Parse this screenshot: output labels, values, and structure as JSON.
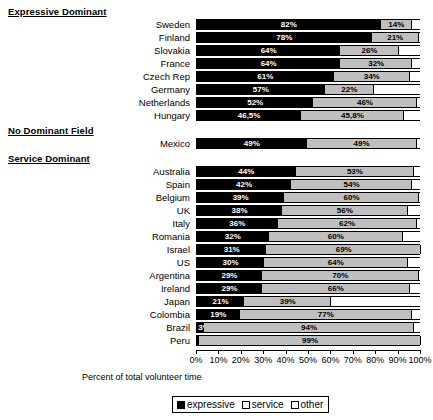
{
  "chart_data": {
    "type": "bar",
    "orientation": "horizontal",
    "stacked": true,
    "title": "",
    "xlabel": "Percent of total volunteer time",
    "ylabel": "",
    "xlim": [
      0,
      100
    ],
    "grid": false,
    "legend_position": "bottom",
    "axis_ticks": [
      "0%",
      "10%",
      "20%",
      "30%",
      "40%",
      "50%",
      "60%",
      "70%",
      "80%",
      "90%",
      "100%"
    ],
    "axis_tick_values": [
      0,
      10,
      20,
      30,
      40,
      50,
      60,
      70,
      80,
      90,
      100
    ],
    "legend": [
      {
        "name": "expressive",
        "color": "#000000"
      },
      {
        "name": "service",
        "color": "#bfbfbf"
      },
      {
        "name": "other",
        "color": "#ffffff"
      }
    ],
    "series": [
      {
        "name": "expressive",
        "color": "#000000"
      },
      {
        "name": "service",
        "color": "#bfbfbf"
      },
      {
        "name": "other",
        "color": "#ffffff"
      }
    ],
    "groups": [
      {
        "header": "Expressive Dominant",
        "rows": [
          {
            "category": "Sweden",
            "expressive": 82,
            "service": 14,
            "other": 4,
            "label_expressive": "82%",
            "label_service": "14%",
            "label_other": ""
          },
          {
            "category": "Finland",
            "expressive": 78,
            "service": 21,
            "other": 1,
            "label_expressive": "78%",
            "label_service": "21%",
            "label_other": ""
          },
          {
            "category": "Slovakia",
            "expressive": 64,
            "service": 26,
            "other": 10,
            "label_expressive": "64%",
            "label_service": "26%",
            "label_other": ""
          },
          {
            "category": "France",
            "expressive": 64,
            "service": 32,
            "other": 4,
            "label_expressive": "64%",
            "label_service": "32%",
            "label_other": ""
          },
          {
            "category": "Czech Rep",
            "expressive": 61,
            "service": 34,
            "other": 5,
            "label_expressive": "61%",
            "label_service": "34%",
            "label_other": ""
          },
          {
            "category": "Germany",
            "expressive": 57,
            "service": 22,
            "other": 21,
            "label_expressive": "57%",
            "label_service": "22%",
            "label_other": ""
          },
          {
            "category": "Netherlands",
            "expressive": 52,
            "service": 46,
            "other": 2,
            "label_expressive": "52%",
            "label_service": "46%",
            "label_other": ""
          },
          {
            "category": "Hungary",
            "expressive": 46.5,
            "service": 45.8,
            "other": 7.7,
            "label_expressive": "46,5%",
            "label_service": "45,8%",
            "label_other": ""
          }
        ]
      },
      {
        "header": "No Dominant Field",
        "rows": [
          {
            "category": "Mexico",
            "expressive": 49,
            "service": 49,
            "other": 2,
            "label_expressive": "49%",
            "label_service": "49%",
            "label_other": ""
          }
        ]
      },
      {
        "header": "Service Dominant",
        "rows": [
          {
            "category": "Australia",
            "expressive": 44,
            "service": 53,
            "other": 3,
            "label_expressive": "44%",
            "label_service": "53%",
            "label_other": ""
          },
          {
            "category": "Spain",
            "expressive": 42,
            "service": 54,
            "other": 4,
            "label_expressive": "42%",
            "label_service": "54%",
            "label_other": ""
          },
          {
            "category": "Belgium",
            "expressive": 39,
            "service": 60,
            "other": 1,
            "label_expressive": "39%",
            "label_service": "60%",
            "label_other": ""
          },
          {
            "category": "UK",
            "expressive": 38,
            "service": 56,
            "other": 6,
            "label_expressive": "38%",
            "label_service": "56%",
            "label_other": ""
          },
          {
            "category": "Italy",
            "expressive": 36,
            "service": 62,
            "other": 2,
            "label_expressive": "36%",
            "label_service": "62%",
            "label_other": ""
          },
          {
            "category": "Romania",
            "expressive": 32,
            "service": 60,
            "other": 8,
            "label_expressive": "32%",
            "label_service": "60%",
            "label_other": ""
          },
          {
            "category": "Israel",
            "expressive": 31,
            "service": 69,
            "other": 0,
            "label_expressive": "31%",
            "label_service": "69%",
            "label_other": ""
          },
          {
            "category": "US",
            "expressive": 30,
            "service": 64,
            "other": 6,
            "label_expressive": "30%",
            "label_service": "64%",
            "label_other": ""
          },
          {
            "category": "Argentina",
            "expressive": 29,
            "service": 70,
            "other": 1,
            "label_expressive": "29%",
            "label_service": "70%",
            "label_other": ""
          },
          {
            "category": "Ireland",
            "expressive": 29,
            "service": 66,
            "other": 5,
            "label_expressive": "29%",
            "label_service": "66%",
            "label_other": ""
          },
          {
            "category": "Japan",
            "expressive": 21,
            "service": 39,
            "other": 40,
            "label_expressive": "21%",
            "label_service": "39%",
            "label_other": ""
          },
          {
            "category": "Colombia",
            "expressive": 19,
            "service": 77,
            "other": 4,
            "label_expressive": "19%",
            "label_service": "77%",
            "label_other": ""
          },
          {
            "category": "Brazil",
            "expressive": 3,
            "service": 94,
            "other": 3,
            "label_expressive": "3%",
            "label_service": "94%",
            "label_other": ""
          },
          {
            "category": "Peru",
            "expressive": 1,
            "service": 99,
            "other": 0,
            "label_expressive": "",
            "label_service": "99%",
            "label_other": ""
          }
        ]
      }
    ]
  }
}
